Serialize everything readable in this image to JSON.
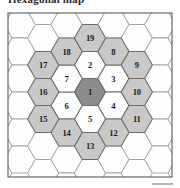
{
  "figure": {
    "caption": "Hexagonal map",
    "frame": {
      "x": 8,
      "y": 13,
      "width": 164,
      "height": 164
    },
    "colors": {
      "center_fill": "#8c8c8c",
      "ring1_fill": "#fdfdfd",
      "ring2_fill": "#c9c9c9",
      "background_fill": "#fefefe",
      "cell_stroke": "#6e6e6e",
      "background_stroke": "#9a9a9a",
      "frame_stroke": "#5a5a5a"
    },
    "geometry": {
      "hex_radius": 15.6,
      "column_step": 23.4,
      "row_step": 27.0,
      "origin_x": 90,
      "origin_y": 92
    },
    "cells": [
      {
        "label": "1",
        "col": 0,
        "row": 0.0,
        "tier": "center"
      },
      {
        "label": "2",
        "col": 0,
        "row": -1.0,
        "tier": "ring1"
      },
      {
        "label": "3",
        "col": 1,
        "row": -0.5,
        "tier": "ring1"
      },
      {
        "label": "4",
        "col": 1,
        "row": 0.5,
        "tier": "ring1"
      },
      {
        "label": "5",
        "col": 0,
        "row": 1.0,
        "tier": "ring1"
      },
      {
        "label": "6",
        "col": -1,
        "row": 0.5,
        "tier": "ring1"
      },
      {
        "label": "7",
        "col": -1,
        "row": -0.5,
        "tier": "ring1"
      },
      {
        "label": "8",
        "col": 1,
        "row": -1.5,
        "tier": "ring2"
      },
      {
        "label": "9",
        "col": 2,
        "row": -1.0,
        "tier": "ring2"
      },
      {
        "label": "10",
        "col": 2,
        "row": 0.0,
        "tier": "ring2"
      },
      {
        "label": "11",
        "col": 2,
        "row": 1.0,
        "tier": "ring2"
      },
      {
        "label": "12",
        "col": 1,
        "row": 1.5,
        "tier": "ring2"
      },
      {
        "label": "13",
        "col": 0,
        "row": 2.0,
        "tier": "ring2"
      },
      {
        "label": "14",
        "col": -1,
        "row": 1.5,
        "tier": "ring2"
      },
      {
        "label": "15",
        "col": -2,
        "row": 1.0,
        "tier": "ring2"
      },
      {
        "label": "16",
        "col": -2,
        "row": 0.0,
        "tier": "ring2"
      },
      {
        "label": "17",
        "col": -2,
        "row": -1.0,
        "tier": "ring2"
      },
      {
        "label": "18",
        "col": -1,
        "row": -1.5,
        "tier": "ring2"
      },
      {
        "label": "19",
        "col": 0,
        "row": -2.0,
        "tier": "ring2"
      }
    ],
    "background_cells": [
      {
        "col": -4,
        "row": -2.0
      },
      {
        "col": -4,
        "row": -1.0
      },
      {
        "col": -4,
        "row": 0.0
      },
      {
        "col": -4,
        "row": 1.0
      },
      {
        "col": -4,
        "row": 2.0
      },
      {
        "col": -4,
        "row": 3.0
      },
      {
        "col": -4,
        "row": -3.0
      },
      {
        "col": -3,
        "row": -2.5
      },
      {
        "col": -3,
        "row": -1.5
      },
      {
        "col": -3,
        "row": -0.5
      },
      {
        "col": -3,
        "row": 0.5
      },
      {
        "col": -3,
        "row": 1.5
      },
      {
        "col": -3,
        "row": 2.5
      },
      {
        "col": -3,
        "row": -3.5
      },
      {
        "col": -2,
        "row": -3.0
      },
      {
        "col": -2,
        "row": -2.0
      },
      {
        "col": -2,
        "row": 2.0
      },
      {
        "col": -2,
        "row": 3.0
      },
      {
        "col": -1,
        "row": -3.5
      },
      {
        "col": -1,
        "row": -2.5
      },
      {
        "col": -1,
        "row": 2.5
      },
      {
        "col": -1,
        "row": 3.5
      },
      {
        "col": 0,
        "row": -3.0
      },
      {
        "col": 0,
        "row": 3.0
      },
      {
        "col": 1,
        "row": -3.5
      },
      {
        "col": 1,
        "row": -2.5
      },
      {
        "col": 1,
        "row": 2.5
      },
      {
        "col": 1,
        "row": 3.5
      },
      {
        "col": 2,
        "row": -3.0
      },
      {
        "col": 2,
        "row": -2.0
      },
      {
        "col": 2,
        "row": 2.0
      },
      {
        "col": 2,
        "row": 3.0
      },
      {
        "col": 3,
        "row": -3.5
      },
      {
        "col": 3,
        "row": -2.5
      },
      {
        "col": 3,
        "row": -1.5
      },
      {
        "col": 3,
        "row": -0.5
      },
      {
        "col": 3,
        "row": 0.5
      },
      {
        "col": 3,
        "row": 1.5
      },
      {
        "col": 3,
        "row": 2.5
      },
      {
        "col": 4,
        "row": -3.0
      },
      {
        "col": 4,
        "row": -2.0
      },
      {
        "col": 4,
        "row": -1.0
      },
      {
        "col": 4,
        "row": 0.0
      },
      {
        "col": 4,
        "row": 1.0
      },
      {
        "col": 4,
        "row": 2.0
      },
      {
        "col": 4,
        "row": 3.0
      }
    ]
  }
}
